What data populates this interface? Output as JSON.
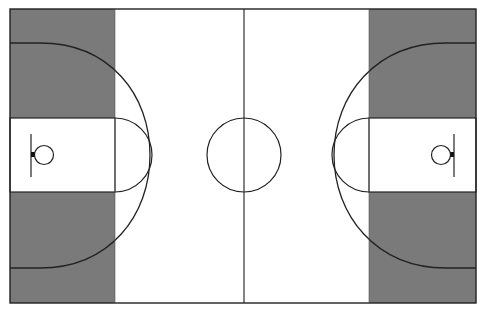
{
  "diagram": {
    "type": "basketball-court",
    "colors": {
      "background": "#ffffff",
      "shaded": "#7a7a7a",
      "lines": "#222222",
      "floor": "#ffffff"
    },
    "court": {
      "x": 10,
      "y": 9,
      "width": 466,
      "height": 294
    },
    "center_line_x": 244,
    "center_circle": {
      "cx": 244,
      "cy": 155,
      "r": 37
    },
    "left": {
      "shaded_zone": {
        "x": 10,
        "y": 9,
        "width": 105,
        "height": 294
      },
      "key": {
        "x": 10,
        "y": 118,
        "width": 105,
        "height": 74
      },
      "free_throw_arc": {
        "cx": 115,
        "cy": 155,
        "r": 37
      },
      "three_point_arc": {
        "top_y": 43,
        "bottom_y": 268,
        "apex_x": 150
      },
      "backboard_x": 32,
      "hoop": {
        "cx": 44,
        "cy": 155,
        "r": 10
      }
    },
    "right": {
      "shaded_zone": {
        "x": 369,
        "y": 9,
        "width": 107,
        "height": 294
      },
      "key": {
        "x": 369,
        "y": 118,
        "width": 107,
        "height": 74
      },
      "free_throw_arc": {
        "cx": 369,
        "cy": 155,
        "r": 37
      },
      "three_point_arc": {
        "top_y": 43,
        "bottom_y": 268,
        "apex_x": 334
      },
      "backboard_x": 454,
      "hoop": {
        "cx": 442,
        "cy": 155,
        "r": 10
      }
    }
  }
}
